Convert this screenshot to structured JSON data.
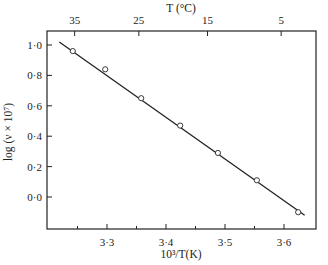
{
  "chart_data": {
    "type": "scatter",
    "title": "",
    "xlabel": "10³/T(K)",
    "ylabel": "log (ν × 10⁷)",
    "top_xlabel": "T (°C)",
    "xlim": [
      3.22,
      3.65
    ],
    "ylim": [
      -0.18,
      1.05
    ],
    "grid": false,
    "legend": null,
    "x_ticks": [
      3.3,
      3.4,
      3.5,
      3.6
    ],
    "x_tick_labels": [
      "3·3",
      "3·4",
      "3·5",
      "3·6"
    ],
    "x_minor_ticks": [
      3.25,
      3.35,
      3.45,
      3.55
    ],
    "y_ticks": [
      0.0,
      0.2,
      0.4,
      0.6,
      0.8,
      1.0
    ],
    "y_tick_labels": [
      "0·0",
      "0·2",
      "0·4",
      "0·6",
      "0·8",
      "1·0"
    ],
    "top_ticks": [
      35,
      25,
      15,
      5
    ],
    "top_tick_labels": [
      "35",
      "25",
      "15",
      "5"
    ],
    "series": [
      {
        "name": "measured",
        "marker": "open-circle",
        "x": [
          3.242,
          3.297,
          3.358,
          3.424,
          3.488,
          3.554,
          3.624
        ],
        "y": [
          0.96,
          0.84,
          0.65,
          0.47,
          0.29,
          0.11,
          -0.1
        ]
      },
      {
        "name": "fit",
        "marker": "line",
        "x": [
          3.22,
          3.635
        ],
        "y": [
          1.02,
          -0.12
        ]
      }
    ]
  }
}
